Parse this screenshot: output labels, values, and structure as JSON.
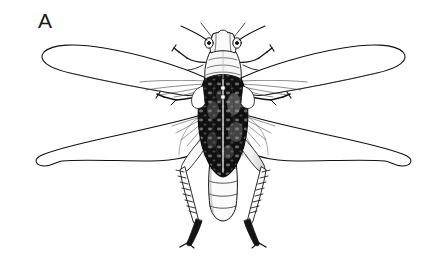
{
  "figure": {
    "panel_label": "A",
    "caption": "",
    "illustration_style": "black-ink-line-drawing",
    "background_color": "#ffffff",
    "ink_color": "#111111",
    "body_fill_color": "#0d0d0d",
    "wing_fill_color": "#ffffff",
    "shade_color": "#6b6b6b",
    "canvas": {
      "width": 446,
      "height": 265
    },
    "parts": [
      {
        "name": "head",
        "label": "head"
      },
      {
        "name": "antennae",
        "label": "antennae",
        "count": 2
      },
      {
        "name": "eyes",
        "label": "compound eyes",
        "count": 2
      },
      {
        "name": "pronotum",
        "label": "pronotum"
      },
      {
        "name": "forewings",
        "label": "forewings",
        "count": 2
      },
      {
        "name": "hindwings",
        "label": "hindwings",
        "count": 2
      },
      {
        "name": "abdomen",
        "label": "abdomen",
        "segments": 5
      },
      {
        "name": "forelegs",
        "label": "forelegs",
        "count": 2
      },
      {
        "name": "midlegs",
        "label": "midlegs",
        "count": 2
      },
      {
        "name": "hindlegs",
        "label": "hindlegs",
        "count": 2
      },
      {
        "name": "thorax-spots",
        "label": "pale thoracic spots",
        "count": 2
      }
    ]
  }
}
